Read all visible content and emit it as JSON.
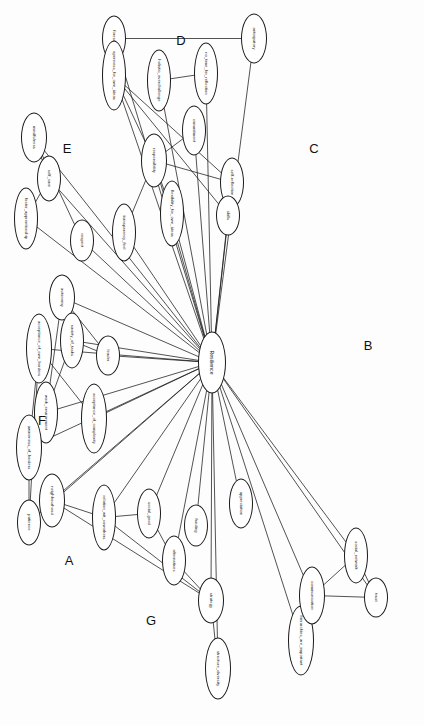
{
  "diagram": {
    "orientation_degrees": 90,
    "center": {
      "id": "resilience",
      "label": "Resilience",
      "x": 362,
      "y": 212,
      "rx": 30,
      "ry": 13
    },
    "clusters": [
      {
        "id": "A",
        "label": "A",
        "x": 560,
        "y": 355
      },
      {
        "id": "B",
        "label": "B",
        "x": 345,
        "y": 56
      },
      {
        "id": "C",
        "label": "C",
        "x": 148,
        "y": 110
      },
      {
        "id": "D",
        "label": "D",
        "x": 40,
        "y": 243
      },
      {
        "id": "E",
        "label": "E",
        "x": 148,
        "y": 357
      },
      {
        "id": "F",
        "label": "F",
        "x": 420,
        "y": 382
      },
      {
        "id": "G",
        "label": "G",
        "x": 620,
        "y": 273
      }
    ],
    "nodes": [
      {
        "id": "anticipatory",
        "label": "anticipatory",
        "cluster": "D",
        "x": 38,
        "y": 170,
        "rx": 24,
        "ry": 12
      },
      {
        "id": "foresight",
        "label": "foresight",
        "cluster": "D",
        "x": 38,
        "y": 310,
        "rx": 22,
        "ry": 11
      },
      {
        "id": "no_time_for_reflection",
        "label": "no_time_for_reflection",
        "cluster": "D",
        "x": 73,
        "y": 218,
        "rx": 30,
        "ry": 11
      },
      {
        "id": "holistic_overchallenge",
        "label": "holistic_overchallenge",
        "cluster": "D",
        "x": 80,
        "y": 265,
        "rx": 30,
        "ry": 11
      },
      {
        "id": "mindfulness",
        "label": "mindfulness",
        "cluster": "E",
        "x": 137,
        "y": 390,
        "rx": 24,
        "ry": 12
      },
      {
        "id": "self_care",
        "label": "self_care",
        "cluster": "E",
        "x": 178,
        "y": 375,
        "rx": 22,
        "ry": 11
      },
      {
        "id": "foster_apprenticeship",
        "label": "foster_apprenticeship",
        "cluster": "E",
        "x": 218,
        "y": 398,
        "rx": 30,
        "ry": 11
      },
      {
        "id": "respect",
        "label": "respect",
        "cluster": "E",
        "x": 240,
        "y": 342,
        "rx": 20,
        "ry": 11
      },
      {
        "id": "responsibility",
        "label": "responsibility",
        "cluster": "C",
        "x": 160,
        "y": 270,
        "rx": 26,
        "ry": 12
      },
      {
        "id": "commitment",
        "label": "commitment",
        "cluster": "C",
        "x": 130,
        "y": 230,
        "rx": 24,
        "ry": 11
      },
      {
        "id": "self_reflection",
        "label": "self-reflection",
        "cluster": "C",
        "x": 182,
        "y": 192,
        "rx": 24,
        "ry": 11
      },
      {
        "id": "skills",
        "label": "skills",
        "cluster": "C",
        "x": 215,
        "y": 196,
        "rx": 19,
        "ry": 11
      },
      {
        "id": "flexibility_for_own_ideas",
        "label": "flexibility_for_own_ideas",
        "cluster": "C",
        "x": 213,
        "y": 252,
        "rx": 32,
        "ry": 11
      },
      {
        "id": "transparency_feel",
        "label": "transparency_feel",
        "cluster": "C",
        "x": 232,
        "y": 300,
        "rx": 28,
        "ry": 11
      },
      {
        "id": "openness_for_own_ideas",
        "label": "openness_for_own_ideas",
        "cluster": "C",
        "x": 75,
        "y": 310,
        "rx": 34,
        "ry": 11
      },
      {
        "id": "autonomy",
        "label": "autonomy",
        "cluster": "B",
        "x": 297,
        "y": 362,
        "rx": 22,
        "ry": 12
      },
      {
        "id": "leader",
        "label": "leader",
        "cluster": "B",
        "x": 355,
        "y": 316,
        "rx": 19,
        "ry": 11
      },
      {
        "id": "variety_of_tasks",
        "label": "variety_of_tasks",
        "cluster": "B",
        "x": 340,
        "y": 352,
        "rx": 27,
        "ry": 11
      },
      {
        "id": "work_environment",
        "label": "work_environment",
        "cluster": "B",
        "x": 412,
        "y": 378,
        "rx": 30,
        "ry": 11
      },
      {
        "id": "neighbourhood",
        "label": "neighbourhood",
        "cluster": "A",
        "x": 500,
        "y": 372,
        "rx": 26,
        "ry": 12
      },
      {
        "id": "relation_wit_coworkers",
        "label": "relation_wit_coworkers",
        "cluster": "A",
        "x": 517,
        "y": 320,
        "rx": 32,
        "ry": 11
      },
      {
        "id": "social_good",
        "label": "social_good",
        "cluster": "A",
        "x": 513,
        "y": 275,
        "rx": 24,
        "ry": 11
      },
      {
        "id": "funding",
        "label": "funding",
        "cluster": "A",
        "x": 525,
        "y": 228,
        "rx": 20,
        "ry": 11
      },
      {
        "id": "appreciation",
        "label": "appreciation",
        "cluster": "A",
        "x": 503,
        "y": 183,
        "rx": 24,
        "ry": 11
      },
      {
        "id": "alternatives",
        "label": "alternatives",
        "cluster": "A",
        "x": 560,
        "y": 250,
        "rx": 24,
        "ry": 11
      },
      {
        "id": "strategy",
        "label": "strategy",
        "cluster": "A",
        "x": 600,
        "y": 213,
        "rx": 22,
        "ry": 12
      },
      {
        "id": "structure_diversity",
        "label": "structure_diversity",
        "cluster": "A",
        "x": 668,
        "y": 206,
        "rx": 30,
        "ry": 12
      },
      {
        "id": "acceptance_of_own_borders",
        "label": "acceptance_of_own_borders",
        "cluster": "F",
        "x": 348,
        "y": 385,
        "rx": 34,
        "ry": 12
      },
      {
        "id": "acceptance_of_complexity",
        "label": "acceptance_of_complexity",
        "cluster": "F",
        "x": 418,
        "y": 330,
        "rx": 34,
        "ry": 12
      },
      {
        "id": "awareness_of_borders",
        "label": "awareness_of_borders",
        "cluster": "F",
        "x": 447,
        "y": 395,
        "rx": 32,
        "ry": 12
      },
      {
        "id": "patience",
        "label": "patience",
        "cluster": "F",
        "x": 522,
        "y": 395,
        "rx": 22,
        "ry": 11
      },
      {
        "id": "hierarchies_are_important",
        "label": "hierarchies_are_important",
        "cluster": "G",
        "x": 640,
        "y": 123,
        "rx": 34,
        "ry": 12
      },
      {
        "id": "communication",
        "label": "communication",
        "cluster": "G",
        "x": 595,
        "y": 112,
        "rx": 28,
        "ry": 12
      },
      {
        "id": "social_network",
        "label": "social_network",
        "cluster": "G",
        "x": 555,
        "y": 68,
        "rx": 27,
        "ry": 11
      },
      {
        "id": "trust",
        "label": "trust",
        "cluster": "G",
        "x": 597,
        "y": 48,
        "rx": 19,
        "ry": 11
      }
    ],
    "edges_from_center": [
      "anticipatory",
      "foresight",
      "no_time_for_reflection",
      "holistic_overchallenge",
      "mindfulness",
      "self_care",
      "foster_apprenticeship",
      "respect",
      "responsibility",
      "commitment",
      "self_reflection",
      "skills",
      "flexibility_for_own_ideas",
      "transparency_feel",
      "openness_for_own_ideas",
      "autonomy",
      "leader",
      "variety_of_tasks",
      "work_environment",
      "neighbourhood",
      "relation_wit_coworkers",
      "social_good",
      "funding",
      "appreciation",
      "alternatives",
      "strategy",
      "structure_diversity",
      "acceptance_of_own_borders",
      "acceptance_of_complexity",
      "awareness_of_borders",
      "patience",
      "hierarchies_are_important",
      "communication",
      "social_network",
      "trust"
    ],
    "edges_between_nodes": [
      [
        "anticipatory",
        "foresight"
      ],
      [
        "no_time_for_reflection",
        "holistic_overchallenge"
      ],
      [
        "mindfulness",
        "self_care"
      ],
      [
        "mindfulness",
        "respect"
      ],
      [
        "self_care",
        "foster_apprenticeship"
      ],
      [
        "responsibility",
        "commitment"
      ],
      [
        "responsibility",
        "openness_for_own_ideas"
      ],
      [
        "responsibility",
        "self_reflection"
      ],
      [
        "responsibility",
        "flexibility_for_own_ideas"
      ],
      [
        "transparency_feel",
        "responsibility"
      ],
      [
        "openness_for_own_ideas",
        "self_reflection"
      ],
      [
        "openness_for_own_ideas",
        "skills"
      ],
      [
        "autonomy",
        "work_environment"
      ],
      [
        "autonomy",
        "leader"
      ],
      [
        "variety_of_tasks",
        "leader"
      ],
      [
        "work_environment",
        "variety_of_tasks"
      ],
      [
        "neighbourhood",
        "relation_wit_coworkers"
      ],
      [
        "relation_wit_coworkers",
        "social_good"
      ],
      [
        "relation_wit_coworkers",
        "strategy"
      ],
      [
        "social_good",
        "alternatives"
      ],
      [
        "alternatives",
        "strategy"
      ],
      [
        "strategy",
        "structure_diversity"
      ],
      [
        "neighbourhood",
        "strategy"
      ],
      [
        "acceptance_of_own_borders",
        "acceptance_of_complexity"
      ],
      [
        "acceptance_of_own_borders",
        "awareness_of_borders"
      ],
      [
        "awareness_of_borders",
        "patience"
      ],
      [
        "acceptance_of_own_borders",
        "patience"
      ],
      [
        "hierarchies_are_important",
        "communication"
      ],
      [
        "communication",
        "social_network"
      ],
      [
        "communication",
        "trust"
      ],
      [
        "social_network",
        "trust"
      ]
    ],
    "style": {
      "stroke": "#1a1a1a",
      "node_fill": "#ffffff",
      "background": "#fdfdfd",
      "text_color": "#111111"
    }
  }
}
